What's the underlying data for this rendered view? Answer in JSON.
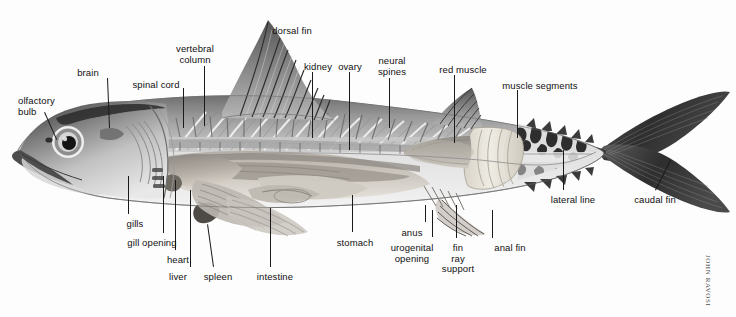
{
  "figure": {
    "background_color": "#fdfdfd",
    "label_color": "#111111",
    "leader_color": "#1a1a1a",
    "credit": "JOHN RAVOSI"
  },
  "labels": [
    {
      "id": "olfactory-bulb",
      "text": "olfactory\nbulb",
      "x": 18,
      "y": 96,
      "align": "l"
    },
    {
      "id": "brain",
      "text": "brain",
      "x": 88,
      "y": 68,
      "align": "c"
    },
    {
      "id": "spinal-cord",
      "text": "spinal cord",
      "x": 156,
      "y": 80,
      "align": "c"
    },
    {
      "id": "vertebral-column",
      "text": "vertebral\ncolumn",
      "x": 195,
      "y": 44,
      "align": "c"
    },
    {
      "id": "dorsal-fin",
      "text": "dorsal fin",
      "x": 292,
      "y": 26,
      "align": "c"
    },
    {
      "id": "kidney",
      "text": "kidney",
      "x": 318,
      "y": 62,
      "align": "c"
    },
    {
      "id": "ovary",
      "text": "ovary",
      "x": 350,
      "y": 62,
      "align": "c"
    },
    {
      "id": "neural-spines",
      "text": "neural\nspines",
      "x": 392,
      "y": 56,
      "align": "c"
    },
    {
      "id": "red-muscle",
      "text": "red muscle",
      "x": 463,
      "y": 65,
      "align": "c"
    },
    {
      "id": "muscle-segments",
      "text": "muscle segments",
      "x": 540,
      "y": 81,
      "align": "c"
    },
    {
      "id": "gills",
      "text": "gills",
      "x": 135,
      "y": 219,
      "align": "c"
    },
    {
      "id": "gill-opening",
      "text": "gill opening",
      "x": 152,
      "y": 238,
      "align": "c"
    },
    {
      "id": "heart",
      "text": "heart",
      "x": 178,
      "y": 255,
      "align": "c"
    },
    {
      "id": "liver",
      "text": "liver",
      "x": 178,
      "y": 272,
      "align": "c"
    },
    {
      "id": "spleen",
      "text": "spleen",
      "x": 218,
      "y": 272,
      "align": "c"
    },
    {
      "id": "intestine",
      "text": "intestine",
      "x": 275,
      "y": 272,
      "align": "c"
    },
    {
      "id": "stomach",
      "text": "stomach",
      "x": 355,
      "y": 238,
      "align": "c"
    },
    {
      "id": "anus",
      "text": "anus",
      "x": 412,
      "y": 228,
      "align": "c"
    },
    {
      "id": "urogenital-opening",
      "text": "urogenital\nopening",
      "x": 412,
      "y": 243,
      "align": "c"
    },
    {
      "id": "fin-ray-support",
      "text": "fin\nray\nsupport",
      "x": 458,
      "y": 243,
      "align": "c"
    },
    {
      "id": "anal-fin",
      "text": "anal fin",
      "x": 510,
      "y": 243,
      "align": "c"
    },
    {
      "id": "lateral-line",
      "text": "lateral line",
      "x": 573,
      "y": 195,
      "align": "c"
    },
    {
      "id": "caudal-fin",
      "text": "caudal fin",
      "x": 655,
      "y": 195,
      "align": "c"
    }
  ],
  "leaders": [
    {
      "id": "olfactory-bulb",
      "x1": 45,
      "y1": 112,
      "x2": 57,
      "y2": 139
    },
    {
      "id": "brain",
      "x1": 108,
      "y1": 78,
      "x2": 110,
      "y2": 128
    },
    {
      "id": "spinal-cord",
      "x1": 184,
      "y1": 88,
      "x2": 184,
      "y2": 128
    },
    {
      "id": "vertebral-column",
      "x1": 205,
      "y1": 66,
      "x2": 205,
      "y2": 126
    },
    {
      "id": "kidney",
      "x1": 313,
      "y1": 72,
      "x2": 313,
      "y2": 138
    },
    {
      "id": "ovary",
      "x1": 350,
      "y1": 72,
      "x2": 350,
      "y2": 150
    },
    {
      "id": "neural-spines",
      "x1": 390,
      "y1": 78,
      "x2": 390,
      "y2": 128
    },
    {
      "id": "red-muscle",
      "x1": 455,
      "y1": 75,
      "x2": 455,
      "y2": 143
    },
    {
      "id": "muscle-segments",
      "x1": 518,
      "y1": 90,
      "x2": 518,
      "y2": 138
    },
    {
      "id": "gills",
      "x1": 128,
      "y1": 214,
      "x2": 128,
      "y2": 176
    },
    {
      "id": "gill-opening",
      "x1": 163,
      "y1": 233,
      "x2": 163,
      "y2": 176
    },
    {
      "id": "heart",
      "x1": 175,
      "y1": 250,
      "x2": 175,
      "y2": 180
    },
    {
      "id": "liver",
      "x1": 190,
      "y1": 267,
      "x2": 190,
      "y2": 190
    },
    {
      "id": "spleen",
      "x1": 213,
      "y1": 267,
      "x2": 207,
      "y2": 224
    },
    {
      "id": "intestine",
      "x1": 270,
      "y1": 267,
      "x2": 270,
      "y2": 208
    },
    {
      "id": "stomach",
      "x1": 352,
      "y1": 232,
      "x2": 352,
      "y2": 195
    },
    {
      "id": "anus",
      "x1": 425,
      "y1": 222,
      "x2": 425,
      "y2": 205
    },
    {
      "id": "urogenital-opening",
      "x1": 432,
      "y1": 237,
      "x2": 432,
      "y2": 210
    },
    {
      "id": "fin-ray-support",
      "x1": 456,
      "y1": 238,
      "x2": 456,
      "y2": 205
    },
    {
      "id": "anal-fin",
      "x1": 492,
      "y1": 238,
      "x2": 492,
      "y2": 210
    },
    {
      "id": "lateral-line",
      "x1": 563,
      "y1": 190,
      "x2": 563,
      "y2": 150
    },
    {
      "id": "caudal-fin",
      "x1": 655,
      "y1": 190,
      "x2": 670,
      "y2": 160
    }
  ]
}
